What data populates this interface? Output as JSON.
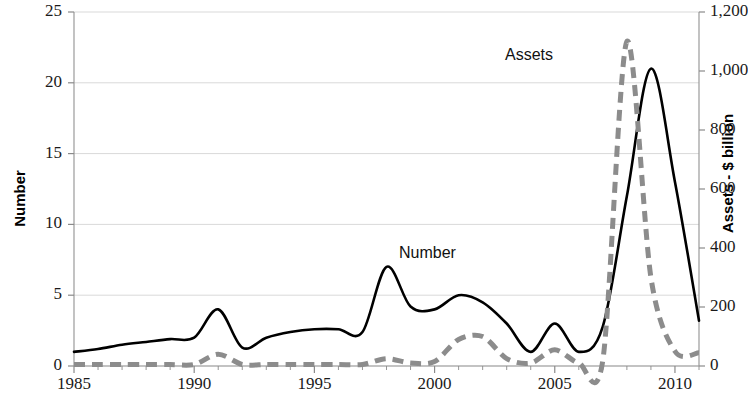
{
  "chart_data": {
    "type": "line",
    "title": "",
    "xlabel": "",
    "ylabel": "Number",
    "y2label": "Assets - $ billion",
    "xlim": [
      1985,
      2011
    ],
    "ylim": [
      0,
      25
    ],
    "y2lim": [
      0,
      1200
    ],
    "grid": true,
    "legend": "inline-labels",
    "x_ticks": [
      "1985",
      "1990",
      "1995",
      "2000",
      "2005",
      "2010"
    ],
    "x_tick_values": [
      1985,
      1990,
      1995,
      2000,
      2005,
      2010
    ],
    "y_left_ticks": [
      "0",
      "5",
      "10",
      "15",
      "20",
      "25"
    ],
    "y_left_tick_values": [
      0,
      5,
      10,
      15,
      20,
      25
    ],
    "y_right_ticks": [
      "0",
      "200",
      "400",
      "600",
      "800",
      "1,000",
      "1,200"
    ],
    "y_right_tick_values": [
      0,
      200,
      400,
      600,
      800,
      1000,
      1200
    ],
    "x": [
      1985,
      1986,
      1987,
      1988,
      1989,
      1990,
      1991,
      1992,
      1993,
      1994,
      1995,
      1996,
      1997,
      1998,
      1999,
      2000,
      2001,
      2002,
      2003,
      2004,
      2005,
      2006,
      2007,
      2008,
      2009,
      2010,
      2011
    ],
    "series": [
      {
        "name": "Number",
        "axis": "left",
        "style": "solid",
        "color": "#000000",
        "label_text": "Number",
        "values": [
          1.0,
          1.2,
          1.5,
          1.7,
          1.9,
          2.0,
          4.0,
          1.3,
          2.0,
          2.4,
          2.6,
          2.6,
          2.4,
          7.0,
          4.2,
          4.0,
          5.0,
          4.5,
          3.0,
          1.0,
          3.0,
          1.0,
          2.8,
          12.0,
          21.0,
          13.0,
          3.2
        ]
      },
      {
        "name": "Assets",
        "axis": "right",
        "style": "dashed",
        "color": "#8c8c8c",
        "label_text": "Assets",
        "values": [
          5,
          5,
          5,
          5,
          5,
          5,
          40,
          5,
          5,
          5,
          5,
          5,
          5,
          25,
          10,
          15,
          90,
          100,
          25,
          10,
          55,
          10,
          20,
          1100,
          300,
          50,
          45
        ]
      }
    ],
    "annotations": [
      {
        "text": "Assets",
        "x": 2007.2,
        "y_right": 1060
      },
      {
        "text": "Number",
        "x": 2001.0,
        "y_left": 8.6
      }
    ]
  },
  "axes": {
    "left_title": "Number",
    "right_title": "Assets - $ billion"
  }
}
